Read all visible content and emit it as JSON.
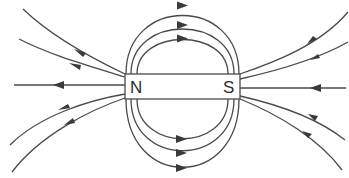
{
  "diagram": {
    "magnet": {
      "north_label": "N",
      "south_label": "S",
      "x": 125,
      "y": 74,
      "width": 115,
      "height": 25
    },
    "colors": {
      "line": "#4a4a4a",
      "arrow": "#3a3a3a",
      "background": "#ffffff",
      "text": "#2e2e2e"
    },
    "field_lines": {
      "top_loops": 3,
      "bottom_loops": 3,
      "left_outgoing": 5,
      "right_incoming": 5,
      "direction": "from N to S"
    }
  }
}
